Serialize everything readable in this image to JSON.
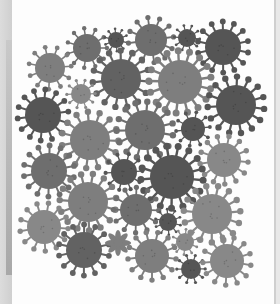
{
  "scene": {
    "description": "Grayscale illustration of coronavirus particles on a white card",
    "background_color": "#e4e4e4",
    "card_color": "#fdfdfd",
    "shades": {
      "dark": "#555555",
      "darkmid": "#626262",
      "mid": "#6e6e6e",
      "light": "#7e7e7e",
      "lighter": "#888888"
    }
  },
  "viruses": [
    {
      "x": 87,
      "y": 48,
      "r": 14,
      "shade": "mid"
    },
    {
      "x": 116,
      "y": 40,
      "r": 8,
      "shade": "dark"
    },
    {
      "x": 151,
      "y": 40,
      "r": 16,
      "shade": "mid"
    },
    {
      "x": 187,
      "y": 38,
      "r": 9,
      "shade": "dark"
    },
    {
      "x": 223,
      "y": 47,
      "r": 18,
      "shade": "dark"
    },
    {
      "x": 50,
      "y": 68,
      "r": 15,
      "shade": "light"
    },
    {
      "x": 121,
      "y": 79,
      "r": 20,
      "shade": "darkmid"
    },
    {
      "x": 180,
      "y": 82,
      "r": 22,
      "shade": "light"
    },
    {
      "x": 81,
      "y": 94,
      "r": 10,
      "shade": "lighter"
    },
    {
      "x": 236,
      "y": 105,
      "r": 20,
      "shade": "dark"
    },
    {
      "x": 43,
      "y": 115,
      "r": 18,
      "shade": "dark"
    },
    {
      "x": 90,
      "y": 140,
      "r": 20,
      "shade": "light"
    },
    {
      "x": 145,
      "y": 130,
      "r": 20,
      "shade": "mid"
    },
    {
      "x": 193,
      "y": 129,
      "r": 12,
      "shade": "dark"
    },
    {
      "x": 224,
      "y": 160,
      "r": 17,
      "shade": "lighter"
    },
    {
      "x": 49,
      "y": 171,
      "r": 18,
      "shade": "mid"
    },
    {
      "x": 124,
      "y": 172,
      "r": 13,
      "shade": "dark"
    },
    {
      "x": 172,
      "y": 177,
      "r": 22,
      "shade": "dark"
    },
    {
      "x": 88,
      "y": 202,
      "r": 20,
      "shade": "light"
    },
    {
      "x": 136,
      "y": 210,
      "r": 16,
      "shade": "mid"
    },
    {
      "x": 168,
      "y": 222,
      "r": 9,
      "shade": "dark"
    },
    {
      "x": 212,
      "y": 214,
      "r": 20,
      "shade": "lighter"
    },
    {
      "x": 44,
      "y": 227,
      "r": 17,
      "shade": "lighter"
    },
    {
      "x": 84,
      "y": 250,
      "r": 18,
      "shade": "darkmid"
    },
    {
      "x": 118,
      "y": 243,
      "r": 9,
      "shade": "light",
      "flower": true
    },
    {
      "x": 152,
      "y": 256,
      "r": 17,
      "shade": "light"
    },
    {
      "x": 185,
      "y": 242,
      "r": 9,
      "shade": "lighter"
    },
    {
      "x": 191,
      "y": 269,
      "r": 10,
      "shade": "dark"
    },
    {
      "x": 227,
      "y": 261,
      "r": 17,
      "shade": "lighter"
    }
  ]
}
